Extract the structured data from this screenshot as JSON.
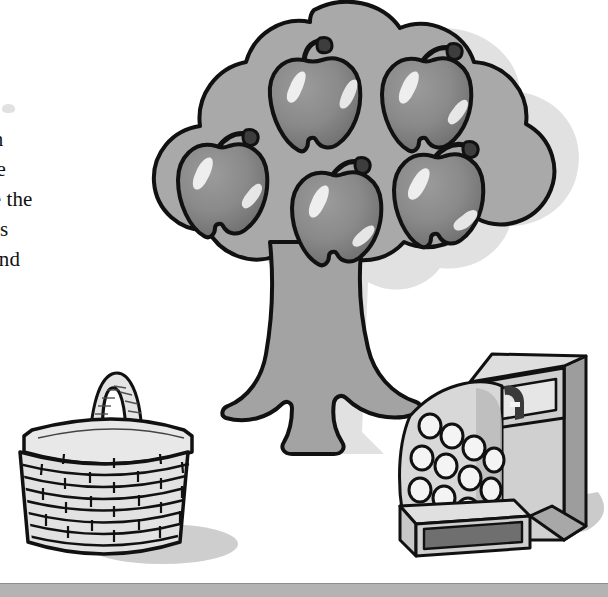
{
  "page": {
    "background_color": "#ffffff",
    "width": 608,
    "height": 597,
    "bottom_rule_color": "#b3b3b3"
  },
  "text_block": {
    "note": "left-clipped body text running down the left margin",
    "lines": [
      "ach",
      "tree",
      "ure the",
      "rees",
      "etend",
      "nd"
    ]
  },
  "illustration": {
    "caption_free": true,
    "scene_name": "apple-tree-basket-cash-register",
    "palette": {
      "canopy_fill": "#a9a9a9",
      "canopy_stroke": "#111111",
      "trunk_fill": "#a3a3a3",
      "apple_fill": "#8a8a8a",
      "apple_stroke": "#111111",
      "apple_highlight": "#f2f2f2",
      "basket_fill": "#e2e2e2",
      "basket_stroke": "#111111",
      "register_light": "#dcdcdc",
      "register_mid": "#c4c4c4",
      "register_dark": "#8f8f8f",
      "register_drawer": "#6f6f6f",
      "shadow": "#bdbdbd",
      "drop_shadow": "#c9c9c9"
    },
    "objects": [
      {
        "name": "apple-tree",
        "apple_count": 5,
        "canopy_lobes": 8,
        "has_trunk": true,
        "has_roots": true
      },
      {
        "name": "wicker-basket",
        "weave_rows": 8,
        "has_handle": true,
        "has_rim": true
      },
      {
        "name": "cash-register",
        "key_count": 12,
        "key_rows": 3,
        "keys_per_row": 4,
        "has_display_window": true,
        "has_drawer": true
      }
    ]
  }
}
